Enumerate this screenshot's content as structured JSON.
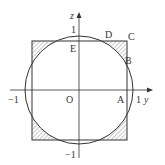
{
  "diagram": {
    "axes": {
      "horizontal": "y",
      "vertical": "z"
    },
    "ticks": {
      "h_neg": "−1",
      "h_pos": "1",
      "v_pos": "1",
      "v_neg": "−1"
    },
    "points": {
      "O": "O",
      "A": "A",
      "B": "B",
      "C": "C",
      "D": "D",
      "E": "E"
    },
    "shapes": [
      "unit circle centered at O",
      "square with shaded corner regions outside circle"
    ]
  }
}
